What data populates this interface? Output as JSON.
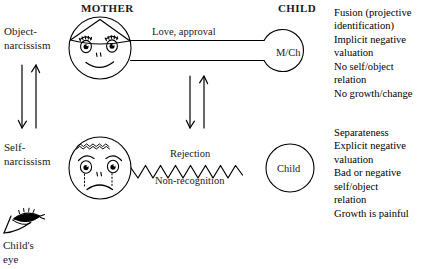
{
  "diagram": {
    "headers": {
      "mother": "MOTHER",
      "child": "CHILD"
    },
    "left_labels": {
      "top": "Object-\nnarcissism",
      "bottom": "Self-\nnarcissism"
    },
    "rows": [
      {
        "id": "object-narcissism",
        "face": "smiling-face",
        "connector": "double-line",
        "edge_label_above": "Love, approval",
        "edge_label_below": "",
        "child_node_label": "M/Ch",
        "outcomes": "Fusion (projective\n    identification)\nImplicit negative\n    valuation\nNo self/object\n    relation\nNo growth/change"
      },
      {
        "id": "self-narcissism",
        "face": "sad-face",
        "connector": "zigzag",
        "edge_label_above": "Rejection",
        "edge_label_below": "Non-recognition",
        "child_node_label": "Child",
        "outcomes": "Separateness\nExplicit negative\n    valuation\nBad or negative\n    self/object\n    relation\nGrowth is painful"
      }
    ],
    "legend": {
      "caption": "Child's\neye",
      "icon": "childs-eye-icon"
    },
    "colors": {
      "ink": "#1a1a1a",
      "stroke": "#000000",
      "background": "#ffffff"
    }
  }
}
